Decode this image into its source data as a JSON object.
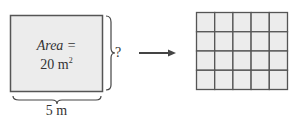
{
  "diagram": {
    "rectangle": {
      "area_label": "Area =",
      "area_value": "20 m",
      "area_unit_exp": "2",
      "width_label": "5 m",
      "height_label": "?",
      "fill": "#ececec",
      "stroke": "#555555"
    },
    "arrow": {
      "color": "#444444"
    },
    "grid": {
      "columns": 5,
      "rows": 4,
      "fill": "#ececec",
      "stroke": "#555555"
    }
  }
}
